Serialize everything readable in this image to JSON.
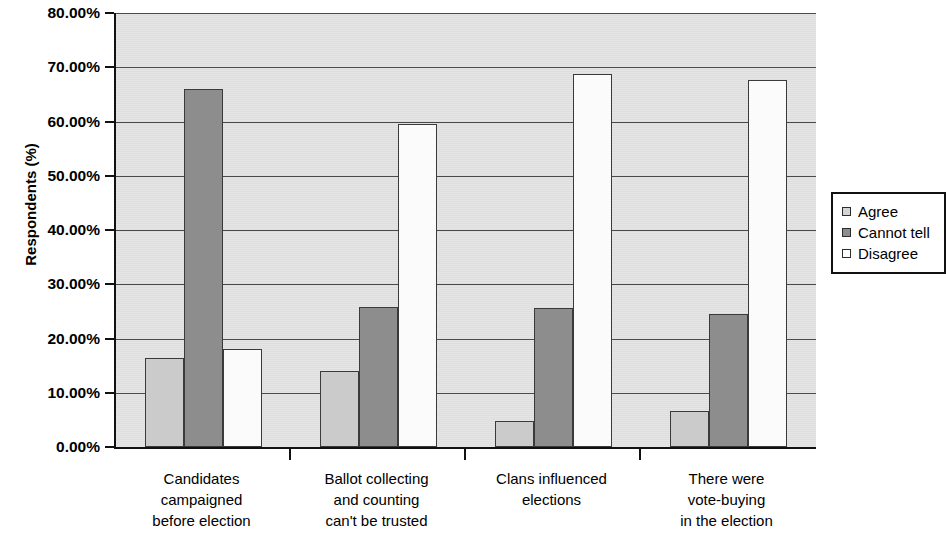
{
  "chart_data": {
    "type": "bar",
    "title": "",
    "xlabel": "",
    "ylabel": "Respondents (%)",
    "ylim": [
      0,
      80
    ],
    "ytick_labels": [
      "0.00%",
      "10.00%",
      "20.00%",
      "30.00%",
      "40.00%",
      "50.00%",
      "60.00%",
      "70.00%",
      "80.00%"
    ],
    "ytick_values": [
      0,
      10,
      20,
      30,
      40,
      50,
      60,
      70,
      80
    ],
    "grid": true,
    "legend_position": "right",
    "categories": [
      "Candidates\ncampaigned\nbefore election",
      "Ballot collecting\nand counting\ncan't be trusted",
      "Clans influenced\nelections",
      "There were\nvote-buying\nin the election"
    ],
    "series": [
      {
        "name": "Agree",
        "color": "#cbcbcb",
        "values": [
          16.4,
          14.0,
          4.8,
          6.6
        ]
      },
      {
        "name": "Cannot tell",
        "color": "#8d8d8d",
        "values": [
          66.0,
          25.9,
          25.7,
          24.6
        ]
      },
      {
        "name": "Disagree",
        "color": "#fbfbfb",
        "values": [
          18.0,
          59.6,
          68.8,
          67.6
        ]
      }
    ]
  },
  "legend": {
    "items": [
      {
        "label": "Agree"
      },
      {
        "label": "Cannot tell"
      },
      {
        "label": "Disagree"
      }
    ]
  }
}
